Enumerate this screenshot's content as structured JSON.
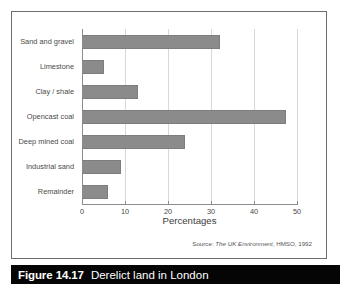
{
  "figure": {
    "caption_number": "Figure 14.17",
    "caption_title": "Derelict land in London",
    "source_label": "Source:",
    "source_title": "The UK Environment",
    "source_rest": ", HMSO, 1992"
  },
  "chart_data": {
    "type": "bar",
    "orientation": "horizontal",
    "title": "",
    "xlabel": "Percentages",
    "ylabel": "",
    "xlim": [
      0,
      50
    ],
    "xticks": [
      0,
      10,
      20,
      30,
      40,
      50
    ],
    "xtick_labels": [
      "0",
      "10",
      "20",
      "30",
      "40",
      "50"
    ],
    "grid": true,
    "legend": false,
    "bar_color": "#8b8b8b",
    "categories": [
      "Sand and gravel",
      "Limestone",
      "Clay / shale",
      "Opencast coal",
      "Deep mined coal",
      "Industrial sand",
      "Remainder"
    ],
    "values": [
      32,
      5,
      13,
      47.5,
      24,
      9,
      6
    ]
  }
}
